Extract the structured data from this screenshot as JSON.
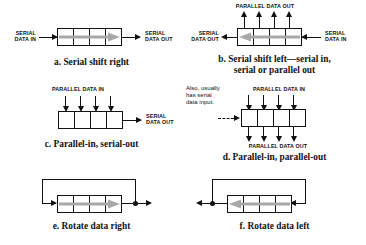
{
  "figure": {
    "background_color": "#ffffff",
    "line_color": "#111111",
    "flow_arrow_color": "#a8a8a8"
  },
  "panels": {
    "a": {
      "caption": "a. Serial shift right",
      "input_label_line1": "SERIAL",
      "input_label_line2": "DATA IN",
      "output_label_line1": "SERIAL",
      "output_label_line2": "DATA OUT",
      "cells": 4,
      "flow_direction": "right"
    },
    "b": {
      "caption_line1": "b. Serial shift left—serial in,",
      "caption_line2": "serial or parallel out",
      "top_label": "PARALLEL DATA OUT",
      "output_label_line1": "SERIAL",
      "output_label_line2": "DATA OUT",
      "input_label_line1": "SERIAL",
      "input_label_line2": "DATA IN",
      "cells": 4,
      "flow_direction": "left",
      "parallel_outputs": 4
    },
    "c": {
      "caption": "c. Parallel-in, serial-out",
      "top_label": "PARALLEL DATA IN",
      "output_label_line1": "SERIAL",
      "output_label_line2": "DATA OUT",
      "cells": 4,
      "parallel_inputs": 4
    },
    "d": {
      "caption": "d. Parallel-in, parallel-out",
      "top_label": "PARALLEL DATA IN",
      "bottom_label": "PARALLEL DATA OUT",
      "note_line1": "Also, usually",
      "note_line2": "has serial",
      "note_line3": "data input.",
      "cells": 4,
      "parallel_inputs": 4,
      "parallel_outputs": 4,
      "serial_input_style": "dashed"
    },
    "e": {
      "caption": "e. Rotate data right",
      "cells": 4,
      "flow_direction": "right",
      "feedback": "right-to-left-over-top"
    },
    "f": {
      "caption": "f. Rotate data left",
      "cells": 4,
      "flow_direction": "left",
      "feedback": "left-to-right-over-top"
    }
  }
}
